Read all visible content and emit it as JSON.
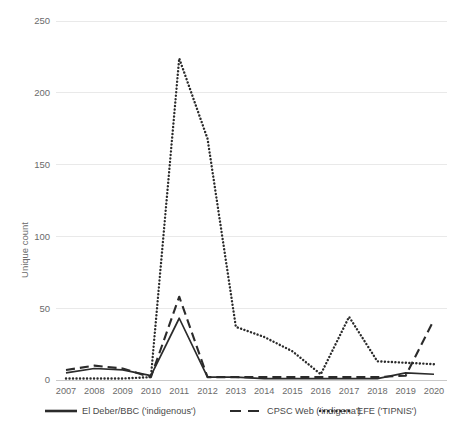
{
  "chart_data": {
    "type": "line",
    "title": "",
    "xlabel": "",
    "ylabel": "Unique count",
    "categories": [
      "2007",
      "2008",
      "2009",
      "2010",
      "2011",
      "2012",
      "2013",
      "2014",
      "2015",
      "2016",
      "2017",
      "2018",
      "2019",
      "2020"
    ],
    "x": [
      2007,
      2008,
      2009,
      2010,
      2011,
      2012,
      2013,
      2014,
      2015,
      2016,
      2017,
      2018,
      2019,
      2020
    ],
    "ylim": [
      0,
      250
    ],
    "yticks": [
      0,
      50,
      100,
      150,
      200,
      250
    ],
    "ytick_labels": [
      "0",
      "50",
      "100",
      "150",
      "200",
      "250"
    ],
    "grid": true,
    "legend_position": "bottom",
    "series": [
      {
        "name": "El Deber/BBC ('indigenous')",
        "style": "solid",
        "color": "#2b2b2b",
        "values": [
          5,
          8,
          7,
          3,
          43,
          2,
          2,
          1,
          1,
          1,
          1,
          1,
          5,
          4
        ]
      },
      {
        "name": "CPSC Web ('indigena')",
        "style": "dashed",
        "color": "#2b2b2b",
        "values": [
          7,
          10,
          8,
          2,
          58,
          2,
          2,
          2,
          2,
          2,
          2,
          2,
          3,
          42
        ]
      },
      {
        "name": "EFE ('TIPNIS')",
        "style": "dotted",
        "color": "#2b2b2b",
        "values": [
          1,
          1,
          1,
          2,
          224,
          168,
          37,
          30,
          20,
          4,
          44,
          13,
          12,
          11
        ]
      }
    ]
  },
  "legend": {
    "items": [
      {
        "label": "El Deber/BBC ('indigenous')",
        "style": "solid"
      },
      {
        "label": "CPSC Web ('indigena')",
        "style": "dashed"
      },
      {
        "label": "EFE ('TIPNIS')",
        "style": "dotted"
      }
    ]
  },
  "axes": {
    "y_title": "Unique count"
  }
}
